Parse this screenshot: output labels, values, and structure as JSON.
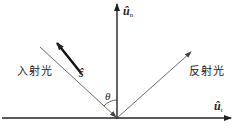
{
  "diagram": {
    "title": "",
    "colors": {
      "line": "#222222",
      "background": "#ffffff"
    },
    "labels": {
      "normal_vector": {
        "base": "û",
        "subscript": "n"
      },
      "tangent_vector": {
        "base": "û",
        "subscript": "t"
      },
      "incident_direction": "ŝ",
      "incident_light": "入射光",
      "reflected_light": "反射光",
      "angle": "θ"
    },
    "elements": [
      {
        "id": "surface",
        "type": "arrow",
        "from": [
          2,
          118
        ],
        "to": [
          232,
          118
        ]
      },
      {
        "id": "normal",
        "type": "arrow",
        "from": [
          117,
          118
        ],
        "to": [
          117,
          3
        ]
      },
      {
        "id": "incident-ray",
        "type": "arrow",
        "from": [
          40,
          47
        ],
        "to": [
          117,
          118
        ]
      },
      {
        "id": "reflected-ray",
        "type": "arrow",
        "from": [
          117,
          118
        ],
        "to": [
          191,
          52
        ]
      },
      {
        "id": "s-vector",
        "type": "bold-arrow",
        "from": [
          81,
          73
        ],
        "to": [
          56,
          42
        ]
      },
      {
        "id": "theta-arc",
        "type": "arc",
        "center": [
          117,
          118
        ],
        "radius": 18
      }
    ]
  }
}
